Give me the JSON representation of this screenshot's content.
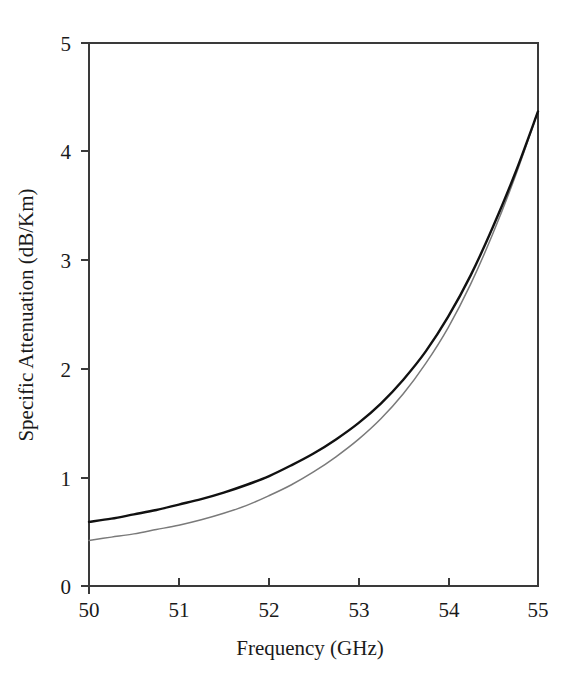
{
  "chart_data": {
    "type": "line",
    "title": "",
    "subtitle": "",
    "xlabel": "Frequency (GHz)",
    "ylabel": "Specific Attenuation (dB/Km)",
    "xlim": [
      50,
      55
    ],
    "ylim": [
      0,
      5
    ],
    "xticks": [
      50,
      51,
      52,
      53,
      54,
      55
    ],
    "xticklabels": [
      "50",
      "51",
      "52",
      "53",
      "54",
      "55"
    ],
    "yticks": [
      0,
      1,
      2,
      3,
      4,
      5
    ],
    "yticklabels": [
      "0",
      "1",
      "2",
      "3",
      "4",
      "5"
    ],
    "grid": false,
    "legend": "none",
    "frame": "box",
    "x": [
      50.0,
      50.25,
      50.5,
      50.75,
      51.0,
      51.25,
      51.5,
      51.75,
      52.0,
      52.25,
      52.5,
      52.75,
      53.0,
      53.25,
      53.5,
      53.75,
      54.0,
      54.25,
      54.5,
      54.75,
      55.0
    ],
    "series": [
      {
        "name": "upper-curve",
        "color": "#111111",
        "width": 2.4,
        "values": [
          0.59,
          0.62,
          0.66,
          0.7,
          0.75,
          0.8,
          0.86,
          0.93,
          1.01,
          1.11,
          1.22,
          1.35,
          1.5,
          1.68,
          1.9,
          2.16,
          2.48,
          2.86,
          3.31,
          3.81,
          4.37
        ]
      },
      {
        "name": "lower-curve",
        "color": "#7a7a7a",
        "width": 1.5,
        "values": [
          0.42,
          0.45,
          0.48,
          0.52,
          0.56,
          0.61,
          0.67,
          0.74,
          0.83,
          0.93,
          1.05,
          1.19,
          1.35,
          1.54,
          1.77,
          2.05,
          2.38,
          2.78,
          3.25,
          3.78,
          4.37
        ]
      }
    ]
  },
  "axes": {
    "x_title": "Frequency (GHz)",
    "y_title": "Specific Attenuation (dB/Km)"
  },
  "xtick_labels": {
    "t0": "50",
    "t1": "51",
    "t2": "52",
    "t3": "53",
    "t4": "54",
    "t5": "55"
  },
  "ytick_labels": {
    "t0": "0",
    "t1": "1",
    "t2": "2",
    "t3": "3",
    "t4": "4",
    "t5": "5"
  },
  "colors": {
    "upper_series": "#111111",
    "lower_series": "#7a7a7a",
    "axis": "#3a3a3a",
    "text": "#1a1a1a",
    "background": "#ffffff"
  }
}
